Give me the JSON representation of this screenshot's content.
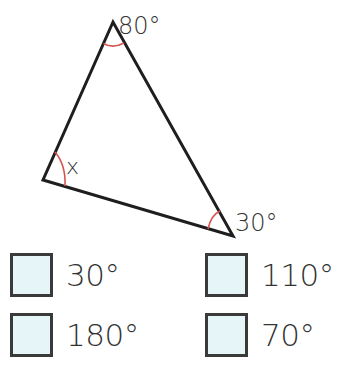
{
  "diagram": {
    "shape": "triangle",
    "angles": {
      "top": "80°",
      "left": "x",
      "right": "30°"
    },
    "colors": {
      "edge": "#1e1e1e",
      "angle_arc": "#d9534f",
      "checkbox_fill": "#e6f6f8"
    }
  },
  "options": [
    {
      "label": "30°"
    },
    {
      "label": "110°"
    },
    {
      "label": "180°"
    },
    {
      "label": "70°"
    }
  ]
}
